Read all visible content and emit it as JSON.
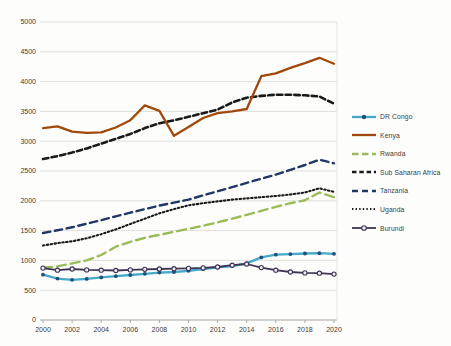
{
  "chart_data": {
    "type": "line",
    "title": "",
    "xlabel": "",
    "ylabel": "",
    "ylim": [
      0,
      5000
    ],
    "grid": true,
    "legend_position": "right",
    "x": [
      2000,
      2001,
      2002,
      2003,
      2004,
      2005,
      2006,
      2007,
      2008,
      2009,
      2010,
      2011,
      2012,
      2013,
      2014,
      2015,
      2016,
      2017,
      2018,
      2019,
      2020
    ],
    "xtick_labels": [
      "2000",
      "2002",
      "2004",
      "2006",
      "2008",
      "2010",
      "2012",
      "2014",
      "2016",
      "2018",
      "2020"
    ],
    "ytick_labels": [
      "0",
      "500",
      "1000",
      "1500",
      "2000",
      "2500",
      "3000",
      "3500",
      "4000",
      "4500",
      "5000"
    ],
    "series": [
      {
        "name": "DR Congo",
        "color": "#45A9C9",
        "marker_color": "#1F4E79",
        "style": "solid-marker",
        "values": [
          760,
          695,
          675,
          690,
          715,
          735,
          755,
          775,
          795,
          805,
          825,
          855,
          885,
          905,
          950,
          1050,
          1095,
          1105,
          1115,
          1120,
          1110
        ]
      },
      {
        "name": "Kenya",
        "color": "#A1490C",
        "style": "solid",
        "values": [
          3220,
          3250,
          3160,
          3140,
          3150,
          3230,
          3350,
          3600,
          3510,
          3090,
          3240,
          3390,
          3470,
          3500,
          3540,
          4090,
          4140,
          4230,
          4310,
          4400,
          4300
        ]
      },
      {
        "name": "Rwanda",
        "color": "#9BBB59",
        "style": "long-dash",
        "values": [
          880,
          900,
          950,
          1000,
          1090,
          1230,
          1310,
          1380,
          1430,
          1480,
          1530,
          1580,
          1640,
          1700,
          1765,
          1830,
          1900,
          1960,
          2010,
          2140,
          2060
        ]
      },
      {
        "name": "Sub Saharan Africa",
        "color": "#1A1A1A",
        "style": "dash",
        "values": [
          2700,
          2750,
          2810,
          2880,
          2960,
          3040,
          3120,
          3220,
          3300,
          3350,
          3410,
          3470,
          3530,
          3650,
          3730,
          3760,
          3780,
          3780,
          3770,
          3750,
          3630
        ]
      },
      {
        "name": "Tanzania",
        "color": "#1F3864",
        "style": "dash2",
        "values": [
          1460,
          1505,
          1555,
          1615,
          1675,
          1740,
          1800,
          1860,
          1920,
          1970,
          2020,
          2090,
          2160,
          2230,
          2300,
          2370,
          2440,
          2520,
          2600,
          2690,
          2630
        ]
      },
      {
        "name": "Uganda",
        "color": "#1A1A1A",
        "style": "dot",
        "values": [
          1250,
          1290,
          1320,
          1370,
          1440,
          1520,
          1610,
          1700,
          1790,
          1860,
          1925,
          1960,
          1990,
          2020,
          2040,
          2060,
          2080,
          2105,
          2140,
          2210,
          2150
        ]
      },
      {
        "name": "Burundi",
        "color": "#3E3456",
        "marker_color": "#F2F0F4",
        "style": "solid-open-marker",
        "values": [
          870,
          835,
          855,
          840,
          835,
          830,
          840,
          850,
          855,
          860,
          865,
          875,
          890,
          920,
          940,
          880,
          835,
          805,
          790,
          785,
          770
        ]
      }
    ]
  }
}
